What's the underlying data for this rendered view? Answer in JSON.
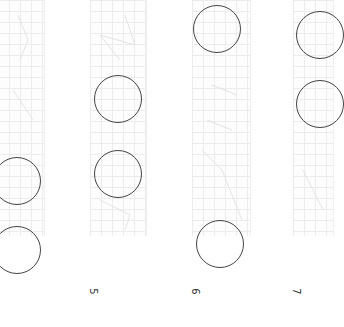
{
  "panels": [
    {
      "label": "",
      "x": -2,
      "width": 46
    },
    {
      "label": "5",
      "x": 90,
      "width": 56
    },
    {
      "label": "6",
      "x": 192,
      "width": 58
    },
    {
      "label": "7",
      "x": 293,
      "width": 40
    }
  ],
  "labels": {
    "p2": "5",
    "p3": "6",
    "p4": "7"
  },
  "circles": [
    {
      "panel": 1,
      "cx": 17,
      "cy": 181,
      "r": 24
    },
    {
      "panel": 1,
      "cx": 17,
      "cy": 250,
      "r": 24
    },
    {
      "panel": 2,
      "cx": 118,
      "cy": 99,
      "r": 24
    },
    {
      "panel": 2,
      "cx": 118,
      "cy": 174,
      "r": 24
    },
    {
      "panel": 3,
      "cx": 217,
      "cy": 29,
      "r": 24
    },
    {
      "panel": 3,
      "cx": 220,
      "cy": 244,
      "r": 24
    },
    {
      "panel": 4,
      "cx": 320,
      "cy": 35,
      "r": 24
    },
    {
      "panel": 4,
      "cx": 320,
      "cy": 104,
      "r": 24
    }
  ],
  "colors": {
    "grid": "#ececec",
    "stroke": "#444444",
    "background": "#ffffff"
  }
}
